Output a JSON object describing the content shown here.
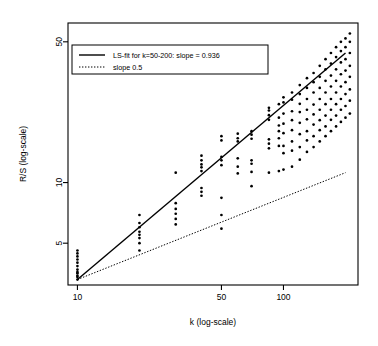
{
  "chart_data": {
    "type": "scatter",
    "title": "",
    "xlabel": "k (log-scale)",
    "ylabel": "R/S (log-scale)",
    "xscale": "log",
    "yscale": "log",
    "grid": false,
    "xlim": [
      9.0,
      230.0
    ],
    "ylim": [
      3.1,
      62.0
    ],
    "xticks": [
      10,
      50,
      100
    ],
    "xtick_labels": [
      "10",
      "50",
      "100"
    ],
    "yticks": [
      5,
      10,
      50
    ],
    "ytick_labels": [
      "5",
      "10",
      "50"
    ],
    "legend": {
      "position": "top-left",
      "border": true,
      "entries": [
        {
          "label": "LS-fit for k=50-200: slope = 0.936",
          "style": "solid"
        },
        {
          "label": "slope 0.5",
          "style": "dotted"
        }
      ]
    },
    "lines": [
      {
        "name": "LS-fit for k=50-200: slope = 0.936",
        "style": "solid",
        "slope": 0.936,
        "x": [
          10,
          200
        ],
        "y": [
          3.3,
          44.0
        ]
      },
      {
        "name": "slope 0.5",
        "style": "dotted",
        "slope": 0.5,
        "x": [
          10,
          200
        ],
        "y": [
          3.3,
          11.2
        ]
      }
    ],
    "series": [
      {
        "name": "R/S estimates",
        "marker": "filled-circle",
        "color": "#000000",
        "points": [
          [
            10,
            3.3
          ],
          [
            10,
            3.4
          ],
          [
            10,
            3.45
          ],
          [
            10,
            3.55
          ],
          [
            10,
            3.6
          ],
          [
            10,
            3.7
          ],
          [
            10,
            3.85
          ],
          [
            10,
            4.0
          ],
          [
            10,
            4.15
          ],
          [
            10,
            4.3
          ],
          [
            10,
            4.45
          ],
          [
            10,
            4.6
          ],
          [
            20,
            4.6
          ],
          [
            20,
            5.0
          ],
          [
            20,
            5.3
          ],
          [
            20,
            5.5
          ],
          [
            20,
            5.7
          ],
          [
            20,
            6.0
          ],
          [
            20,
            6.3
          ],
          [
            20,
            6.9
          ],
          [
            30,
            6.2
          ],
          [
            30,
            6.6
          ],
          [
            30,
            7.0
          ],
          [
            30,
            7.4
          ],
          [
            30,
            7.9
          ],
          [
            30,
            11.2
          ],
          [
            40,
            8.6
          ],
          [
            40,
            9.0
          ],
          [
            40,
            9.4
          ],
          [
            40,
            11.4
          ],
          [
            40,
            11.9
          ],
          [
            40,
            12.3
          ],
          [
            40,
            12.9
          ],
          [
            40,
            13.6
          ],
          [
            50,
            5.9
          ],
          [
            50,
            6.9
          ],
          [
            50,
            8.4
          ],
          [
            50,
            12.2
          ],
          [
            50,
            12.9
          ],
          [
            50,
            13.4
          ],
          [
            50,
            16.2
          ],
          [
            50,
            17.0
          ],
          [
            60,
            11.1
          ],
          [
            60,
            12.0
          ],
          [
            60,
            13.2
          ],
          [
            60,
            16.0
          ],
          [
            60,
            16.6
          ],
          [
            60,
            17.5
          ],
          [
            70,
            9.6
          ],
          [
            70,
            11.3
          ],
          [
            70,
            12.4
          ],
          [
            70,
            12.9
          ],
          [
            70,
            16.5
          ],
          [
            70,
            17.3
          ],
          [
            70,
            18.0
          ],
          [
            85,
            11.2
          ],
          [
            85,
            14.8
          ],
          [
            85,
            15.6
          ],
          [
            85,
            16.4
          ],
          [
            85,
            20.5
          ],
          [
            85,
            21.6
          ],
          [
            85,
            22.8
          ],
          [
            85,
            23.5
          ],
          [
            95,
            11.4
          ],
          [
            95,
            15.2
          ],
          [
            95,
            16.6
          ],
          [
            95,
            18.0
          ],
          [
            95,
            19.2
          ],
          [
            95,
            21.0
          ],
          [
            95,
            24.5
          ],
          [
            100,
            11.6
          ],
          [
            100,
            14.0
          ],
          [
            100,
            15.2
          ],
          [
            100,
            17.6
          ],
          [
            100,
            19.6
          ],
          [
            100,
            22.0
          ],
          [
            100,
            25.0
          ],
          [
            100,
            26.5
          ],
          [
            110,
            12.0
          ],
          [
            110,
            14.4
          ],
          [
            110,
            16.0
          ],
          [
            110,
            18.2
          ],
          [
            110,
            20.4
          ],
          [
            110,
            22.6
          ],
          [
            110,
            25.8
          ],
          [
            110,
            28.0
          ],
          [
            120,
            13.0
          ],
          [
            120,
            15.0
          ],
          [
            120,
            17.4
          ],
          [
            120,
            19.8
          ],
          [
            120,
            22.4
          ],
          [
            120,
            24.6
          ],
          [
            120,
            27.5
          ],
          [
            120,
            30.5
          ],
          [
            130,
            14.2
          ],
          [
            130,
            16.2
          ],
          [
            130,
            18.0
          ],
          [
            130,
            20.6
          ],
          [
            130,
            23.0
          ],
          [
            130,
            26.0
          ],
          [
            130,
            29.5
          ],
          [
            130,
            33.0
          ],
          [
            140,
            15.0
          ],
          [
            140,
            17.0
          ],
          [
            140,
            19.4
          ],
          [
            140,
            21.8
          ],
          [
            140,
            24.4
          ],
          [
            140,
            28.0
          ],
          [
            140,
            31.5
          ],
          [
            140,
            35.0
          ],
          [
            150,
            16.0
          ],
          [
            150,
            18.2
          ],
          [
            150,
            20.4
          ],
          [
            150,
            23.0
          ],
          [
            150,
            26.0
          ],
          [
            150,
            29.5
          ],
          [
            150,
            33.5
          ],
          [
            150,
            38.0
          ],
          [
            160,
            17.0
          ],
          [
            160,
            19.0
          ],
          [
            160,
            21.5
          ],
          [
            160,
            24.5
          ],
          [
            160,
            28.0
          ],
          [
            160,
            32.0
          ],
          [
            160,
            36.5
          ],
          [
            160,
            41.0
          ],
          [
            170,
            18.0
          ],
          [
            170,
            20.5
          ],
          [
            170,
            23.0
          ],
          [
            170,
            26.0
          ],
          [
            170,
            30.0
          ],
          [
            170,
            34.0
          ],
          [
            170,
            39.0
          ],
          [
            170,
            44.0
          ],
          [
            180,
            19.0
          ],
          [
            180,
            21.5
          ],
          [
            180,
            24.5
          ],
          [
            180,
            28.0
          ],
          [
            180,
            32.0
          ],
          [
            180,
            36.5
          ],
          [
            180,
            42.0
          ],
          [
            180,
            47.0
          ],
          [
            190,
            20.0
          ],
          [
            190,
            23.0
          ],
          [
            190,
            26.0
          ],
          [
            190,
            30.0
          ],
          [
            190,
            34.5
          ],
          [
            190,
            39.5
          ],
          [
            190,
            45.0
          ],
          [
            190,
            50.0
          ],
          [
            200,
            21.0
          ],
          [
            200,
            24.0
          ],
          [
            200,
            27.5
          ],
          [
            200,
            31.5
          ],
          [
            200,
            36.0
          ],
          [
            200,
            41.0
          ],
          [
            200,
            47.0
          ],
          [
            200,
            52.0
          ],
          [
            210,
            22.0
          ],
          [
            210,
            25.5
          ],
          [
            210,
            29.0
          ],
          [
            210,
            33.5
          ],
          [
            210,
            38.0
          ],
          [
            210,
            44.0
          ],
          [
            210,
            50.0
          ],
          [
            210,
            55.0
          ]
        ]
      }
    ]
  }
}
